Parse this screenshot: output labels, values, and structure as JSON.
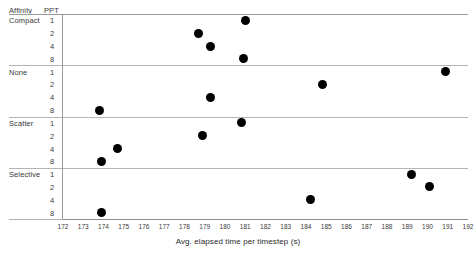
{
  "table_headers": {
    "affinity": "Affinity",
    "ppt": "PPT"
  },
  "axis_title": "Avg. elapsed time per timestep (s)",
  "xticks": [
    "172",
    "173",
    "174",
    "175",
    "176",
    "177",
    "178",
    "179",
    "180",
    "181",
    "182",
    "183",
    "184",
    "185",
    "186",
    "187",
    "188",
    "189",
    "190",
    "191",
    "192"
  ],
  "groups": [
    {
      "label": "Compact",
      "ppt": [
        "1",
        "2",
        "4",
        "8"
      ]
    },
    {
      "label": "None",
      "ppt": [
        "1",
        "2",
        "4",
        "8"
      ]
    },
    {
      "label": "Scatter",
      "ppt": [
        "1",
        "2",
        "4",
        "8"
      ]
    },
    {
      "label": "Selective",
      "ppt": [
        "1",
        "2",
        "4",
        "8"
      ]
    }
  ],
  "colors": {
    "marker": "#000000",
    "rule": "#9a9a9a",
    "axis": "#8e8e8e",
    "text": "#2a2a2a",
    "background": "#ffffff"
  },
  "chart_data": {
    "type": "scatter",
    "title": "",
    "xlabel": "Avg. elapsed time per timestep (s)",
    "ylabel": "",
    "xlim": [
      172,
      192
    ],
    "grid": false,
    "legend": "none",
    "y_categories": [
      "Compact / 1",
      "Compact / 2",
      "Compact / 4",
      "Compact / 8",
      "None / 1",
      "None / 2",
      "None / 4",
      "None / 8",
      "Scatter / 1",
      "Scatter / 2",
      "Scatter / 4",
      "Scatter / 8",
      "Selective / 1",
      "Selective / 2",
      "Selective / 4",
      "Selective / 8"
    ],
    "points": [
      {
        "affinity": "Compact",
        "ppt": 1,
        "x": 181.0
      },
      {
        "affinity": "Compact",
        "ppt": 2,
        "x": 178.7
      },
      {
        "affinity": "Compact",
        "ppt": 4,
        "x": 179.3
      },
      {
        "affinity": "Compact",
        "ppt": 8,
        "x": 180.9
      },
      {
        "affinity": "None",
        "ppt": 1,
        "x": 190.9
      },
      {
        "affinity": "None",
        "ppt": 2,
        "x": 184.8
      },
      {
        "affinity": "None",
        "ppt": 4,
        "x": 179.3
      },
      {
        "affinity": "None",
        "ppt": 8,
        "x": 173.8
      },
      {
        "affinity": "Scatter",
        "ppt": 1,
        "x": 180.8
      },
      {
        "affinity": "Scatter",
        "ppt": 2,
        "x": 178.9
      },
      {
        "affinity": "Scatter",
        "ppt": 4,
        "x": 174.7
      },
      {
        "affinity": "Scatter",
        "ppt": 8,
        "x": 173.9
      },
      {
        "affinity": "Selective",
        "ppt": 1,
        "x": 189.2
      },
      {
        "affinity": "Selective",
        "ppt": 2,
        "x": 190.1
      },
      {
        "affinity": "Selective",
        "ppt": 4,
        "x": 184.2
      },
      {
        "affinity": "Selective",
        "ppt": 8,
        "x": 173.9
      }
    ]
  }
}
